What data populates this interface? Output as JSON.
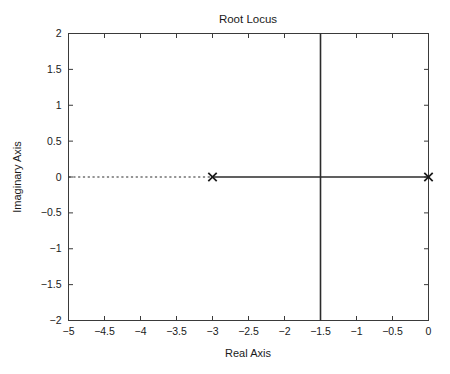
{
  "chart_data": {
    "type": "scatter",
    "title": "Root Locus",
    "xlabel": "Real Axis",
    "ylabel": "Imaginary Axis",
    "xlim": [
      -5,
      0
    ],
    "ylim": [
      -2,
      2
    ],
    "grid": false,
    "legend": "none",
    "xticks": [
      -5,
      -4.5,
      -4,
      -3.5,
      -3,
      -2.5,
      -2,
      -1.5,
      -1,
      -0.5,
      0
    ],
    "xticklabels": [
      "−5",
      "−4.5",
      "−4",
      "−3.5",
      "−3",
      "−2.5",
      "−2",
      "−1.5",
      "−1",
      "−0.5",
      "0"
    ],
    "yticks": [
      -2,
      -1.5,
      -1,
      -0.5,
      0,
      0.5,
      1,
      1.5,
      2
    ],
    "yticklabels": [
      "−2",
      "−1.5",
      "−1",
      "−0.5",
      "0",
      "0.5",
      "1",
      "1.5",
      "2"
    ],
    "poles": [
      {
        "marker": "x",
        "real": -3,
        "imag": 0
      },
      {
        "marker": "x",
        "real": 0,
        "imag": 0
      }
    ],
    "zeros": [],
    "branches": [
      {
        "name": "real-axis-segment",
        "style": "solid",
        "points": [
          [
            -3,
            0
          ],
          [
            0,
            0
          ]
        ]
      },
      {
        "name": "vertical-branch-upper",
        "style": "solid",
        "points": [
          [
            -1.5,
            0
          ],
          [
            -1.5,
            2
          ]
        ]
      },
      {
        "name": "vertical-branch-lower",
        "style": "solid",
        "points": [
          [
            -1.5,
            0
          ],
          [
            -1.5,
            -2
          ]
        ]
      }
    ],
    "reference_lines": [
      {
        "name": "real-axis-dashed",
        "style": "dashed",
        "points": [
          [
            -5,
            0
          ],
          [
            -3,
            0
          ]
        ]
      }
    ],
    "colors": {
      "axis": "#3a3a3a",
      "locus": "#2b2b2b",
      "text": "#1a1a1a",
      "background": "#ffffff"
    }
  }
}
